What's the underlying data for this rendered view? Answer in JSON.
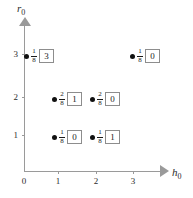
{
  "chart_data": {
    "type": "scatter",
    "title": "",
    "xlabel": "h_0",
    "ylabel": "r_0",
    "xlim": [
      0,
      3.6
    ],
    "ylim": [
      0,
      3.6
    ],
    "grid": false,
    "legend": null,
    "x_ticks": [
      "0",
      "1",
      "2",
      "3"
    ],
    "y_ticks": [
      "0",
      "1",
      "2",
      "3"
    ],
    "points": [
      {
        "x": 0,
        "y": 3,
        "fraction_numerator": "1",
        "fraction_denominator": "8",
        "boxed_value": "3"
      },
      {
        "x": 3,
        "y": 3,
        "fraction_numerator": "1",
        "fraction_denominator": "8",
        "boxed_value": "0"
      },
      {
        "x": 1,
        "y": 2,
        "fraction_numerator": "2",
        "fraction_denominator": "8",
        "boxed_value": "1"
      },
      {
        "x": 2,
        "y": 2,
        "fraction_numerator": "2",
        "fraction_denominator": "8",
        "boxed_value": "0"
      },
      {
        "x": 1,
        "y": 1,
        "fraction_numerator": "1",
        "fraction_denominator": "8",
        "boxed_value": "0"
      },
      {
        "x": 2,
        "y": 1,
        "fraction_numerator": "1",
        "fraction_denominator": "8",
        "boxed_value": "1"
      }
    ]
  },
  "axes": {
    "x": {
      "label_letter": "h",
      "label_subscript": "0",
      "ticks": [
        {
          "label": "0",
          "px": 24
        },
        {
          "label": "1",
          "px": 58
        },
        {
          "label": "2",
          "px": 96
        },
        {
          "label": "3",
          "px": 133
        }
      ]
    },
    "y": {
      "label_letter": "r",
      "label_subscript": "0",
      "ticks": [
        {
          "label": "1",
          "px": 135
        },
        {
          "label": "2",
          "px": 97
        },
        {
          "label": "3",
          "px": 54
        }
      ]
    }
  },
  "colors": {
    "background": "#ffffff",
    "axis": "#9a9a9a",
    "text": "#1a1a1a",
    "marker": "#111111",
    "box_border": "#8d8d8d"
  },
  "point_positions": [
    {
      "left": 24,
      "top": 48
    },
    {
      "left": 130,
      "top": 48
    },
    {
      "left": 52,
      "top": 91
    },
    {
      "left": 90,
      "top": 91
    },
    {
      "left": 52,
      "top": 129
    },
    {
      "left": 90,
      "top": 129
    }
  ]
}
